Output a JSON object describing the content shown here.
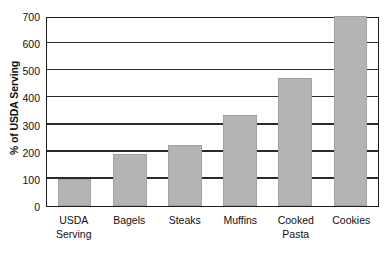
{
  "chart_data": {
    "type": "bar",
    "title": "",
    "subtitle": "",
    "xlabel": "",
    "ylabel": "% of USDA Serving",
    "categories": [
      "USDA Serving",
      "Bagels",
      "Steaks",
      "Muffins",
      "Cooked Pasta",
      "Cookies"
    ],
    "category_lines": [
      [
        "USDA",
        "Serving"
      ],
      [
        "Bagels"
      ],
      [
        "Steaks"
      ],
      [
        "Muffins"
      ],
      [
        "Cooked",
        "Pasta"
      ],
      [
        "Cookies"
      ]
    ],
    "values": [
      100,
      190,
      225,
      335,
      470,
      700
    ],
    "ylim": [
      0,
      700
    ],
    "ytick_step": 100,
    "yticks": [
      0,
      100,
      200,
      300,
      400,
      500,
      600,
      700
    ],
    "ytick_labels": [
      "0",
      "100",
      "200",
      "300",
      "400",
      "500",
      "600",
      "700"
    ],
    "grid": true,
    "grid_axis": "y",
    "legend": false,
    "legend_position": "none",
    "bar_color": "#b4b4b4",
    "bar_edge_color": "#a2a2a2",
    "axis_color": "#1b1b1b",
    "grid_color": "#2a2a2a",
    "background_color": "#ffffff"
  }
}
